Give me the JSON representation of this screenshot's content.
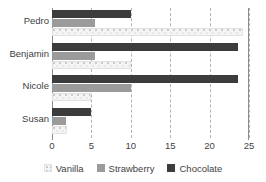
{
  "chart_data": {
    "type": "bar",
    "orientation": "horizontal",
    "title": "",
    "xlabel": "",
    "ylabel": "",
    "categories": [
      "Pedro",
      "Benjamin",
      "Nicole",
      "Susan"
    ],
    "series": [
      {
        "name": "Vanilla",
        "color": "#f4f4f4",
        "values": [
          24.3,
          10.0,
          5.0,
          1.9
        ]
      },
      {
        "name": "Strawberry",
        "color": "#9b9b9b",
        "values": [
          5.5,
          5.5,
          10.0,
          1.8
        ]
      },
      {
        "name": "Chocolate",
        "color": "#3c3c3c",
        "values": [
          10.0,
          23.6,
          23.6,
          5.0
        ]
      }
    ],
    "xlim": [
      0,
      25
    ],
    "xticks": [
      0,
      5,
      10,
      15,
      20,
      25
    ],
    "xticklabels": [
      "0",
      "5",
      "10",
      "15",
      "20",
      "25"
    ],
    "grid": true,
    "grid_style": "dashed-vertical",
    "legend_position": "bottom"
  },
  "legend": {
    "items": [
      {
        "label": "Vanilla"
      },
      {
        "label": "Strawberry"
      },
      {
        "label": "Chocolate"
      }
    ]
  }
}
